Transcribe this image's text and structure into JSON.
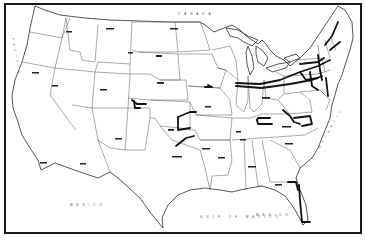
{
  "map": {
    "title": "United States route map",
    "colors": {
      "ink": "#111111",
      "border": "#555555",
      "background": "#ffffff"
    },
    "labels": {
      "north": "CANADA",
      "south": "MEXICO",
      "west": "PACIFIC",
      "east": "ATLANTIC",
      "gulf": "GULF OF MEXICO",
      "south_east": "MEXICO"
    }
  }
}
